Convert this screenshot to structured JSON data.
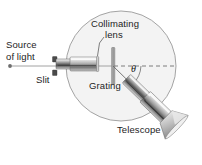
{
  "figure": {
    "background_color": "#ffffff",
    "ink_color": "#1d1d1d",
    "labels": {
      "source": "Source",
      "of_light": "of light",
      "slit": "Slit",
      "collimating": "Collimating",
      "lens": "lens",
      "grating": "Grating",
      "theta": "θ",
      "telescope": "Telescope"
    },
    "components": {
      "table": {
        "name": "spectrometer-table",
        "shape": "circle",
        "center_x": 121,
        "center_y": 66,
        "radius": 55,
        "stroke": "#8a8a8a",
        "fill": "#f2f2f2"
      },
      "light_source_point": {
        "name": "light-source-point",
        "x": 10,
        "y": 66,
        "color": "#6e6e6e"
      },
      "incident_ray": {
        "name": "incident-light-ray",
        "x1": 10,
        "y1": 66,
        "x2": 113,
        "y2": 66,
        "color": "#9a9a9a"
      },
      "collimator_tube": {
        "name": "collimator-tube",
        "x": 52,
        "y": 58,
        "width": 45,
        "height": 13,
        "orientation": "horizontal"
      },
      "grating_plate": {
        "name": "grating-plate",
        "x": 113,
        "y_top": 48,
        "y_bottom": 85,
        "color": "#9b9b9b"
      },
      "reference_axis": {
        "name": "reference-axis-dashed-line",
        "x1": 113,
        "y1": 66,
        "x2": 176,
        "y2": 66,
        "style": "dashed",
        "color": "#7d7d7d"
      },
      "diffracted_ray": {
        "name": "diffracted-ray",
        "x1": 113,
        "y1": 66,
        "x2": 160,
        "y2": 112,
        "color": "#6a6a6a"
      },
      "telescope_tube": {
        "name": "telescope-tube",
        "angle_deg": 44,
        "length": 62,
        "width": 13
      },
      "eyepiece": {
        "name": "telescope-eyepiece-cone",
        "x": 168,
        "y": 128
      }
    },
    "angle_value_label": "θ"
  }
}
